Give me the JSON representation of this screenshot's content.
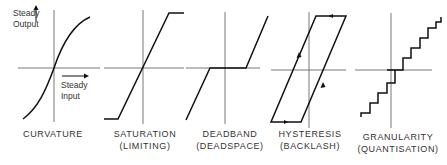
{
  "axes": {
    "y_label_line1": "Steady",
    "y_label_line2": "Output",
    "x_label_line1": "Steady",
    "x_label_line2": "Input"
  },
  "panels": [
    {
      "title": "CURVATURE",
      "subtitle": ""
    },
    {
      "title": "SATURATION",
      "subtitle": "(LIMITING)"
    },
    {
      "title": "DEADBAND",
      "subtitle": "(DEADSPACE)"
    },
    {
      "title": "HYSTERESIS",
      "subtitle": "(BACKLASH)"
    },
    {
      "title": "GRANULARITY",
      "subtitle": "(QUANTISATION)"
    }
  ],
  "colors": {
    "line": "#111111",
    "axis": "#555555",
    "background": "#ffffff"
  }
}
